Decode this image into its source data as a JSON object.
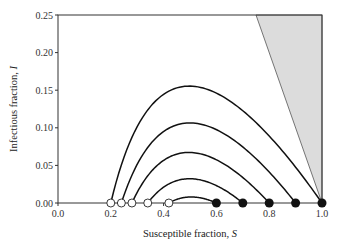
{
  "chart_data": {
    "type": "line",
    "title": "",
    "xlabel": "Susceptible fraction, ",
    "xlabel_var": "S",
    "ylabel": "Infectious fraction, ",
    "ylabel_var": "I",
    "xlim": [
      0.0,
      1.0
    ],
    "ylim": [
      0.0,
      0.25
    ],
    "xticks": [
      "0.0",
      "0.2",
      "0.4",
      "0.6",
      "0.8",
      "1.0"
    ],
    "yticks": [
      "0.00",
      "0.05",
      "0.10",
      "0.15",
      "0.20",
      "0.25"
    ],
    "grid": false,
    "shaded_region": {
      "description": "infeasible region S + I > 1",
      "fill": "#dcdcdc",
      "vertices": [
        [
          0.75,
          0.25
        ],
        [
          1.0,
          0.25
        ],
        [
          1.0,
          0.0
        ]
      ]
    },
    "series": [
      {
        "name": "trajectory-1",
        "start_S": 1.0,
        "end_S": 0.2,
        "peak_I": 0.153
      },
      {
        "name": "trajectory-2",
        "start_S": 0.9,
        "end_S": 0.24,
        "peak_I": 0.106
      },
      {
        "name": "trajectory-3",
        "start_S": 0.8,
        "end_S": 0.28,
        "peak_I": 0.062
      },
      {
        "name": "trajectory-4",
        "start_S": 0.7,
        "end_S": 0.34,
        "peak_I": 0.033
      },
      {
        "name": "trajectory-5",
        "start_S": 0.6,
        "end_S": 0.42,
        "peak_I": 0.013
      }
    ],
    "markers": {
      "filled_start_points_S": [
        0.6,
        0.7,
        0.8,
        0.9,
        1.0
      ],
      "open_end_points_S": [
        0.2,
        0.24,
        0.28,
        0.34,
        0.42
      ]
    },
    "colors": {
      "line": "#111111",
      "axis": "#333333",
      "shade": "#dcdcdc"
    }
  }
}
